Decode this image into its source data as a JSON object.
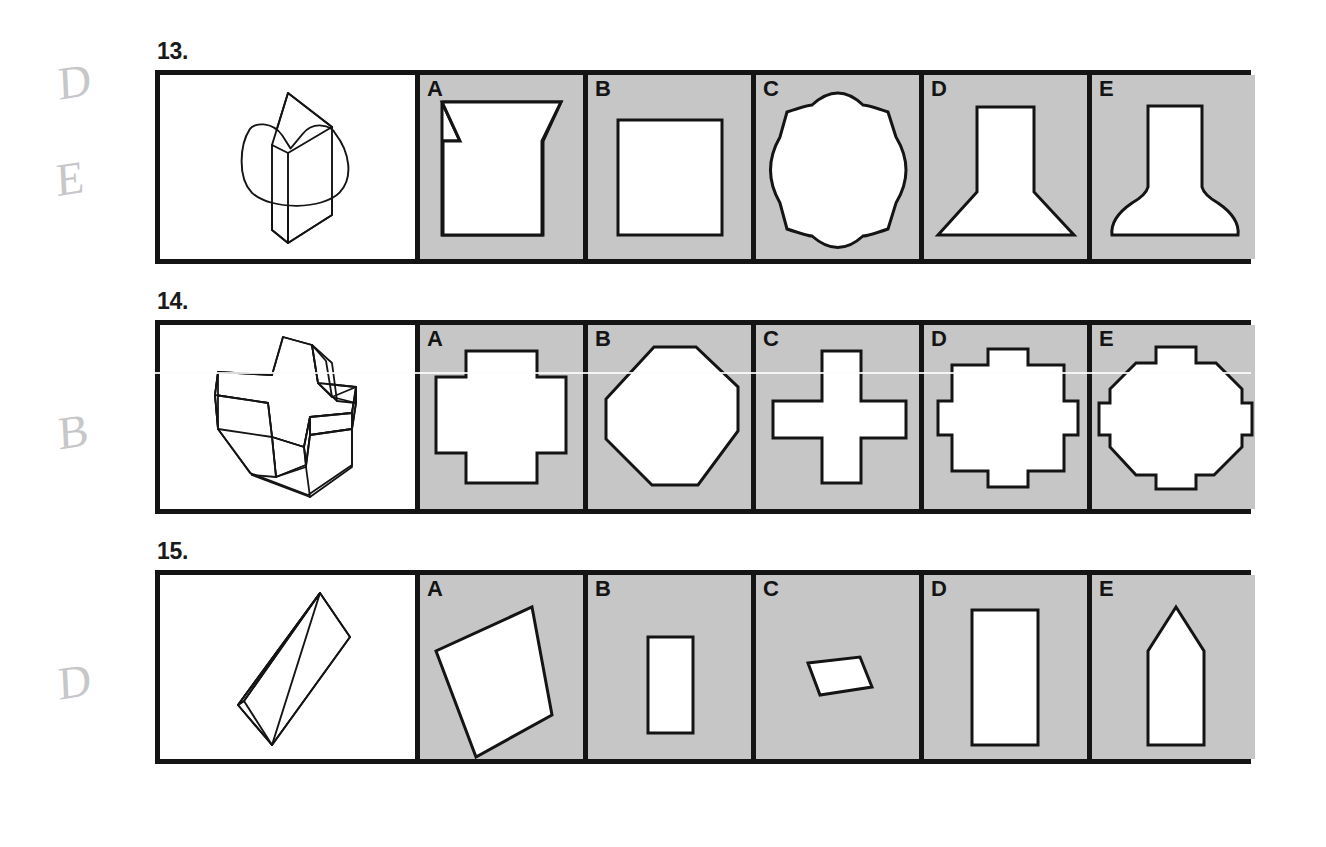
{
  "page": {
    "background_color": "#ffffff",
    "ink_color": "#141414",
    "panel_gray": "#c6c6c6",
    "stimulus_background": "#ffffff"
  },
  "margin_marks": [
    {
      "text": "D",
      "top": 55,
      "left": 58
    },
    {
      "text": "E",
      "top": 152,
      "left": 56
    },
    {
      "text": "B",
      "top": 405,
      "left": 58
    },
    {
      "text": "D",
      "top": 655,
      "left": 58
    }
  ],
  "questions": [
    {
      "number": "13.",
      "top": 40,
      "stimulus": {
        "name": "square-prism-on-curved-base",
        "description": "Vertical square prism standing on a rounded scalloped base"
      },
      "options": [
        {
          "letter": "A",
          "shape": "flared-neck-vase",
          "description": "Rectangle body with outward flared trapezoid top"
        },
        {
          "letter": "B",
          "shape": "square",
          "description": "Plain square"
        },
        {
          "letter": "C",
          "shape": "bulged-square",
          "description": "Square with outward bulging curved sides"
        },
        {
          "letter": "D",
          "shape": "flared-base-column",
          "description": "Narrow column widening to a broad base"
        },
        {
          "letter": "E",
          "shape": "bell-bottle",
          "description": "Straight neck over a domed bell-shaped base"
        }
      ]
    },
    {
      "number": "14.",
      "top": 290,
      "stimulus": {
        "name": "cross-shaped-block",
        "description": "Three dimensional plus-shaped block viewed in perspective"
      },
      "options": [
        {
          "letter": "A",
          "shape": "thick-greek-cross",
          "description": "Square with shallow notched corners forming a thick cross"
        },
        {
          "letter": "B",
          "shape": "octagon-diamond",
          "description": "Rounded octagon oriented as a diamond"
        },
        {
          "letter": "C",
          "shape": "thin-greek-cross",
          "description": "Slender equal armed cross"
        },
        {
          "letter": "D",
          "shape": "tabbed-square",
          "description": "Square with a small rectangular tab on each side"
        },
        {
          "letter": "E",
          "shape": "tabbed-octagon",
          "description": "Octagon with a small rectangular tab on each side"
        }
      ]
    },
    {
      "number": "15.",
      "top": 540,
      "stimulus": {
        "name": "tilted-rectangular-slab",
        "description": "Long thin rectangular slab tilted diagonally in perspective"
      },
      "options": [
        {
          "letter": "A",
          "shape": "large-tilted-quadrilateral",
          "description": "Large slightly rotated quadrilateral"
        },
        {
          "letter": "B",
          "shape": "small-upright-rectangle",
          "description": "Small narrow upright rectangle"
        },
        {
          "letter": "C",
          "shape": "small-tilted-parallelogram",
          "description": "Small rotated parallelogram"
        },
        {
          "letter": "D",
          "shape": "tall-rectangle",
          "description": "Tall narrow upright rectangle"
        },
        {
          "letter": "E",
          "shape": "pointed-pentagon",
          "description": "Upright rectangle with a pointed peaked top"
        }
      ]
    }
  ]
}
